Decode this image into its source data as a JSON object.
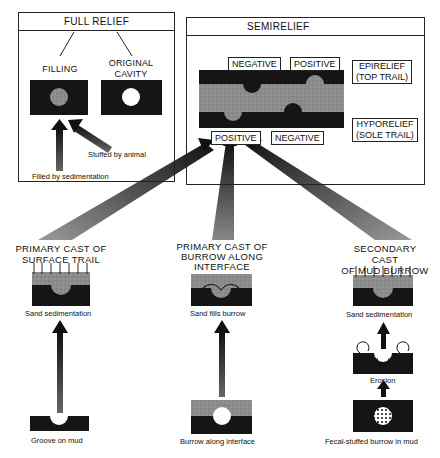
{
  "full_relief": {
    "title": "FULL RELIEF",
    "filling_label": "FILLING",
    "original_cavity_label": "ORIGINAL\nCAVITY",
    "stuffed_caption": "Stuffed by animal",
    "sedimentation_caption": "Filled by sedimentation"
  },
  "semirelief": {
    "title": "SEMIRELIEF",
    "top_negative": "NEGATIVE",
    "top_positive": "POSITIVE",
    "bottom_positive": "POSITIVE",
    "bottom_negative": "NEGATIVE",
    "epirelief": "EPIRELIEF\n(TOP TRAIL)",
    "hyporelief": "HYPORELIEF\n(SOLE TRAIL)"
  },
  "columns": [
    {
      "heading": "PRIMARY CAST OF\nSURFACE TRAIL",
      "process_caption": "Sand sedimentation",
      "origin_caption": "Groove on mud"
    },
    {
      "heading": "PRIMARY CAST OF\nBURROW ALONG\nINTERFACE",
      "process_caption": "Sand fills burrow",
      "origin_caption": "Burrow along interface"
    },
    {
      "heading": "SECONDARY CAST\nOF MUD BURROW",
      "process_caption": "Sand sedimentation",
      "intermediate_caption": "Erosion",
      "origin_caption": "Fecal-stuffed burrow in mud"
    }
  ],
  "colors": {
    "mud": "#151515",
    "sand": "#8a8a8a",
    "line": "#222222"
  }
}
